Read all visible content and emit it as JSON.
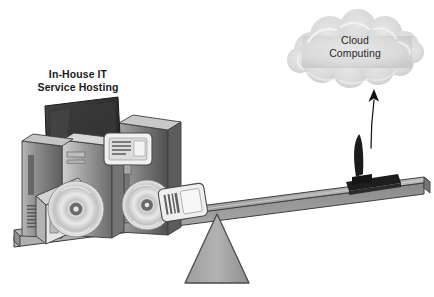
{
  "diagram": {
    "type": "conceptual-illustration",
    "background_color": "#ffffff",
    "labels": {
      "left": {
        "name": "in-house-it-label",
        "line1": "In-House IT",
        "line2": "Service Hosting",
        "color": "#1c1a1b"
      },
      "right": {
        "name": "cloud-computing-label",
        "line1": "Cloud",
        "line2": "Computing",
        "color": "#2a2728"
      }
    },
    "elements": {
      "cloud": {
        "name": "cloud-shape",
        "fill": "#dcdcdc",
        "stroke": "#f2f2f2"
      },
      "arrow": {
        "name": "upward-arrow",
        "color": "#141414",
        "direction": "up"
      },
      "plank": {
        "name": "seesaw-plank",
        "top_face": "#a9a9a9",
        "front_face": "#8e8e8e",
        "edge": "#4a4a4a",
        "tilt": "left side down, right side up"
      },
      "fulcrum": {
        "name": "fulcrum-triangle",
        "fill": "#a8a8a8",
        "stroke": "#4f4f4f"
      },
      "equipment_left": {
        "name": "server-equipment-cluster",
        "items": [
          "crt-monitor",
          "server-tower-left",
          "server-tower-center",
          "server-tower-right",
          "optical-disc-large",
          "optical-disc-small",
          "flat-panel-display",
          "document-panel",
          "desktop-case"
        ],
        "palette": [
          "#6f6f6f",
          "#9a9a9a",
          "#c4c4c4",
          "#e3e3e3",
          "#3a3a3a"
        ]
      },
      "device_right": {
        "name": "thin-client-laptop",
        "fill": "#1b1b1b"
      }
    }
  }
}
